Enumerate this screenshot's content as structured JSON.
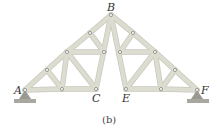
{
  "diagram": {
    "type": "truss",
    "caption": "(b)",
    "colors": {
      "member": "#dcdcd0",
      "member_edge": "#c8c8bc",
      "pin": "#888888",
      "support": "#9a9a90",
      "ground": "#a8a8a0",
      "label": "#333333"
    },
    "labels": {
      "A": "A",
      "B": "B",
      "C": "C",
      "E": "E",
      "F": "F"
    },
    "nodes": {
      "A": [
        25,
        90
      ],
      "L1": [
        47,
        70
      ],
      "L2": [
        67,
        52
      ],
      "L3": [
        90,
        33
      ],
      "B": [
        111,
        15
      ],
      "L4": [
        104,
        52
      ],
      "LB1": [
        62,
        89
      ],
      "C": [
        96,
        89
      ],
      "R3": [
        133,
        33
      ],
      "R2": [
        155,
        52
      ],
      "R1": [
        175,
        70
      ],
      "F": [
        197,
        90
      ],
      "R4": [
        120,
        52
      ],
      "RB1": [
        161,
        89
      ],
      "E": [
        126,
        89
      ]
    },
    "members": [
      [
        "A",
        "L1"
      ],
      [
        "L1",
        "L2"
      ],
      [
        "L2",
        "L3"
      ],
      [
        "L3",
        "B"
      ],
      [
        "B",
        "R3"
      ],
      [
        "R3",
        "R2"
      ],
      [
        "R2",
        "R1"
      ],
      [
        "R1",
        "F"
      ],
      [
        "A",
        "LB1"
      ],
      [
        "LB1",
        "C"
      ],
      [
        "E",
        "RB1"
      ],
      [
        "RB1",
        "F"
      ],
      [
        "L1",
        "LB1"
      ],
      [
        "L2",
        "LB1"
      ],
      [
        "L2",
        "C"
      ],
      [
        "L2",
        "L4"
      ],
      [
        "L3",
        "L4"
      ],
      [
        "B",
        "C"
      ],
      [
        "B",
        "E"
      ],
      [
        "R4",
        "R3"
      ],
      [
        "R4",
        "R2"
      ],
      [
        "R2",
        "E"
      ],
      [
        "R2",
        "RB1"
      ],
      [
        "R1",
        "RB1"
      ]
    ]
  }
}
